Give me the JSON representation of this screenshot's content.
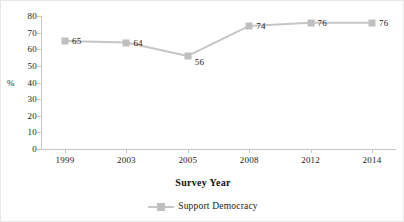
{
  "chart_data": {
    "type": "line",
    "title": "",
    "xlabel": "Survey Year",
    "ylabel": "%",
    "categories": [
      "1999",
      "2003",
      "2005",
      "2008",
      "2012",
      "2014"
    ],
    "series": [
      {
        "name": "Support Democracy",
        "values": [
          65,
          64,
          56,
          74,
          76,
          76
        ]
      }
    ],
    "data_labels": [
      "65",
      "64",
      "56",
      "74",
      "76",
      "76"
    ],
    "ylim": [
      0,
      80
    ],
    "y_ticks": [
      "80",
      "70",
      "60",
      "50",
      "40",
      "30",
      "20",
      "10",
      "0"
    ],
    "y_tick_values": [
      80,
      70,
      60,
      50,
      40,
      30,
      20,
      10,
      0
    ],
    "grid": false,
    "legend_position": "bottom-center",
    "colors": {
      "series_line": "#c6c6c6",
      "marker": "#bfbfbf",
      "axis": "#c7c7c7",
      "text": "#1a1a1a"
    }
  },
  "legend": {
    "entries": [
      {
        "label": "Support Democracy",
        "marker": "square-marker"
      }
    ]
  }
}
